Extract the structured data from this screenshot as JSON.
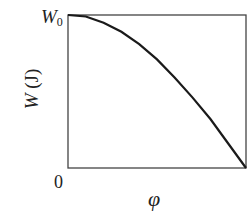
{
  "chart_data": {
    "type": "line",
    "title": "",
    "xlabel": "φ",
    "ylabel": "W (J)",
    "ylabel_var": "W",
    "ylabel_unit": "(J)",
    "x_tick_labels": [
      "0"
    ],
    "y_tick_labels": [
      "W0"
    ],
    "y_tick_main": "W",
    "y_tick_sub": "0",
    "grid": false,
    "legend": null,
    "series": [
      {
        "name": "W(φ)",
        "x": [
          0,
          0.1,
          0.2,
          0.3,
          0.4,
          0.5,
          0.6,
          0.7,
          0.8,
          0.9,
          1.0
        ],
        "values": [
          1.0,
          0.99,
          0.95,
          0.89,
          0.81,
          0.71,
          0.59,
          0.46,
          0.32,
          0.16,
          0.0
        ]
      }
    ],
    "xlim": [
      0,
      1
    ],
    "ylim": [
      0,
      1
    ],
    "colors": {
      "curve": "#1a1a1a",
      "axes": "#333333"
    }
  }
}
